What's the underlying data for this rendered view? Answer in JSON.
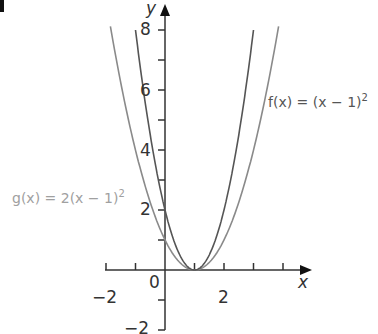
{
  "chart_data": {
    "type": "line",
    "title": "",
    "xlabel": "x",
    "ylabel": "y",
    "xlim": [
      -2,
      4.8
    ],
    "ylim": [
      -2.2,
      8.6
    ],
    "x_ticks": [
      -2,
      -1,
      0,
      1,
      2,
      3,
      4
    ],
    "x_tick_labels": [
      "-2",
      "0",
      "2"
    ],
    "y_ticks": [
      -2,
      -1,
      0,
      1,
      2,
      3,
      4,
      5,
      6,
      7,
      8
    ],
    "y_tick_labels": [
      "-2",
      "2",
      "4",
      "6",
      "8"
    ],
    "grid": false,
    "series": [
      {
        "name": "f(x) = (x − 1)^2",
        "expression": "(x-1)^2",
        "color": "#8a8a8a",
        "x": [
          -1.8,
          -1,
          0,
          1,
          2,
          3,
          3.8
        ],
        "y": [
          7.84,
          4,
          1,
          0,
          1,
          4,
          7.84
        ]
      },
      {
        "name": "g(x) = 2(x − 1)^2",
        "expression": "2(x-1)^2",
        "color": "#555555",
        "x": [
          -1,
          0,
          1,
          2,
          3
        ],
        "y": [
          8,
          2,
          0,
          2,
          8
        ]
      }
    ],
    "annotations": [
      {
        "text": "f(x) = (x − 1)^2",
        "position": "right of curves near y=5"
      },
      {
        "text": "g(x) = 2(x − 1)^2",
        "position": "left of curves near y=2.5"
      }
    ]
  },
  "labels": {
    "x_axis": "x",
    "y_axis": "y",
    "tick_x_neg2": "−2",
    "tick_origin": "0",
    "tick_x_2": "2",
    "tick_y_2": "2",
    "tick_y_4": "4",
    "tick_y_6": "6",
    "tick_y_8": "8",
    "tick_y_neg2": "−2",
    "f_name": "f(x) = (x − 1)",
    "f_exp": "2",
    "g_name": "g(x) = 2(x − 1)",
    "g_exp": "2"
  },
  "colors": {
    "axis": "#333333",
    "f_curve": "#8a8a8a",
    "g_curve": "#555555",
    "f_label": "#555555",
    "g_label": "#a0a0a0"
  }
}
